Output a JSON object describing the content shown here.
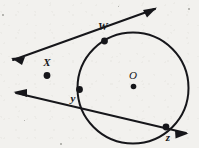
{
  "figure": {
    "kind": "geometry-diagram",
    "background_color": "#f2f1ee",
    "ink_color": "#16161a",
    "width": 199,
    "height": 148,
    "circle": {
      "label": "O",
      "center_label": "O",
      "cx": 133,
      "cy": 88,
      "r": 55.5,
      "stroke_width": 2.0
    },
    "center_dot": {
      "cx": 133.5,
      "cy": 86.5,
      "r": 2.6
    },
    "labels": [
      {
        "id": "label-w",
        "text": "W",
        "x": 103,
        "y": 30
      },
      {
        "id": "label-x",
        "text": "X",
        "x": 47,
        "y": 66
      },
      {
        "id": "label-y",
        "text": "y",
        "x": 73,
        "y": 101
      },
      {
        "id": "label-z",
        "text": "z",
        "x": 168,
        "y": 140
      },
      {
        "id": "label-o",
        "text": "O",
        "x": 133,
        "y": 78
      }
    ],
    "points": [
      {
        "id": "point-w",
        "label": "W",
        "cx": 104.5,
        "cy": 41.0,
        "r": 3.2
      },
      {
        "id": "point-x",
        "label": "X",
        "cx": 47.0,
        "cy": 75.5,
        "r": 3.2
      },
      {
        "id": "point-y",
        "label": "y",
        "cx": 79.5,
        "cy": 89.5,
        "r": 3.2
      },
      {
        "id": "point-z",
        "label": "z",
        "cx": 166.0,
        "cy": 127.0,
        "r": 3.2
      }
    ],
    "lines": [
      {
        "id": "line-tangent-xw",
        "name": "tangent-line-through-x-and-w",
        "from": [
          13.0,
          60.0
        ],
        "to": [
          155.0,
          9.0
        ],
        "stroke_width": 2.0,
        "arrow_start": true,
        "arrow_end": true
      },
      {
        "id": "line-secant-xyz",
        "name": "secant-line-through-x-y-z",
        "from": [
          16.0,
          93.0
        ],
        "to": [
          186.0,
          133.0
        ],
        "stroke_width": 2.0,
        "arrow_start": true,
        "arrow_end": true
      }
    ],
    "arrowheads": [
      {
        "id": "arrow-upper-left",
        "tip": [
          11.0,
          58.0
        ],
        "angle_deg": 199.7
      },
      {
        "id": "arrow-lower-left",
        "tip": [
          13.5,
          92.0
        ],
        "angle_deg": 193.2
      },
      {
        "id": "arrow-upper-right",
        "tip": [
          157.0,
          7.5
        ],
        "angle_deg": 19.7
      },
      {
        "id": "arrow-lower-right",
        "tip": [
          188.5,
          133.5
        ],
        "angle_deg": 13.2
      }
    ]
  }
}
